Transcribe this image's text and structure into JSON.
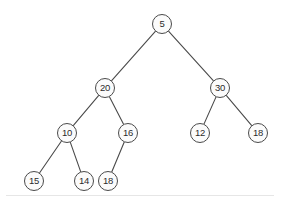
{
  "diagram": {
    "type": "binary-tree",
    "width": 282,
    "height": 203,
    "background_color": "#ffffff",
    "node_fill_color": "#fbfbfb",
    "node_stroke_color": "#4a4a4a",
    "edge_color": "#4a4a4a",
    "label_color": "#2b2b2b",
    "node_radius": 10,
    "baseline": {
      "visible": true,
      "y": 195,
      "color": "#e6e6e6"
    }
  },
  "nodes": [
    {
      "id": "n5",
      "label": "5",
      "cx": 162,
      "cy": 24,
      "level": 0
    },
    {
      "id": "n20",
      "label": "20",
      "cx": 105,
      "cy": 88,
      "level": 1
    },
    {
      "id": "n30",
      "label": "30",
      "cx": 220,
      "cy": 88,
      "level": 1
    },
    {
      "id": "n10",
      "label": "10",
      "cx": 67,
      "cy": 133,
      "level": 2
    },
    {
      "id": "n16",
      "label": "16",
      "cx": 128,
      "cy": 133,
      "level": 2
    },
    {
      "id": "n12",
      "label": "12",
      "cx": 200,
      "cy": 133,
      "level": 2
    },
    {
      "id": "n18r",
      "label": "18",
      "cx": 258,
      "cy": 133,
      "level": 2
    },
    {
      "id": "n15",
      "label": "15",
      "cx": 34,
      "cy": 181,
      "level": 3
    },
    {
      "id": "n14",
      "label": "14",
      "cx": 84,
      "cy": 181,
      "level": 3
    },
    {
      "id": "n18l",
      "label": "18",
      "cx": 108,
      "cy": 181,
      "level": 3
    }
  ],
  "edges": [
    {
      "from": "n5",
      "to": "n20",
      "side": "left"
    },
    {
      "from": "n5",
      "to": "n30",
      "side": "right"
    },
    {
      "from": "n20",
      "to": "n10",
      "side": "left"
    },
    {
      "from": "n20",
      "to": "n16",
      "side": "right"
    },
    {
      "from": "n30",
      "to": "n12",
      "side": "left"
    },
    {
      "from": "n30",
      "to": "n18r",
      "side": "right"
    },
    {
      "from": "n10",
      "to": "n15",
      "side": "left"
    },
    {
      "from": "n10",
      "to": "n14",
      "side": "right"
    },
    {
      "from": "n16",
      "to": "n18l",
      "side": "left"
    }
  ],
  "chart_data": {
    "type": "diagram",
    "title": "",
    "values": [
      5,
      20,
      30,
      10,
      16,
      12,
      18,
      15,
      14,
      18
    ]
  }
}
